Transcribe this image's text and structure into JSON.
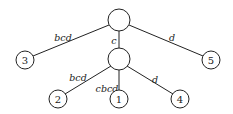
{
  "diagram": {
    "type": "tree",
    "nodes": [
      {
        "id": "root",
        "label": "",
        "x": 119,
        "y": 20,
        "r": 11
      },
      {
        "id": "mid",
        "label": "",
        "x": 119,
        "y": 59,
        "r": 11
      },
      {
        "id": "n3",
        "label": "3",
        "x": 25,
        "y": 60,
        "r": 9
      },
      {
        "id": "n5",
        "label": "5",
        "x": 211,
        "y": 60,
        "r": 9
      },
      {
        "id": "n2",
        "label": "2",
        "x": 58,
        "y": 99,
        "r": 9
      },
      {
        "id": "n1",
        "label": "1",
        "x": 119,
        "y": 99,
        "r": 9
      },
      {
        "id": "n4",
        "label": "4",
        "x": 180,
        "y": 99,
        "r": 9
      }
    ],
    "edges": [
      {
        "from": "root",
        "to": "n3",
        "label": "bcd",
        "lx": 63,
        "ly": 37
      },
      {
        "from": "root",
        "to": "mid",
        "label": "c",
        "lx": 114,
        "ly": 40
      },
      {
        "from": "root",
        "to": "n5",
        "label": "d",
        "lx": 172,
        "ly": 37
      },
      {
        "from": "mid",
        "to": "n2",
        "label": "bcd",
        "lx": 78,
        "ly": 77
      },
      {
        "from": "mid",
        "to": "n1",
        "label": "cbcd",
        "lx": 107,
        "ly": 88
      },
      {
        "from": "mid",
        "to": "n4",
        "label": "d",
        "lx": 155,
        "ly": 79
      }
    ]
  }
}
